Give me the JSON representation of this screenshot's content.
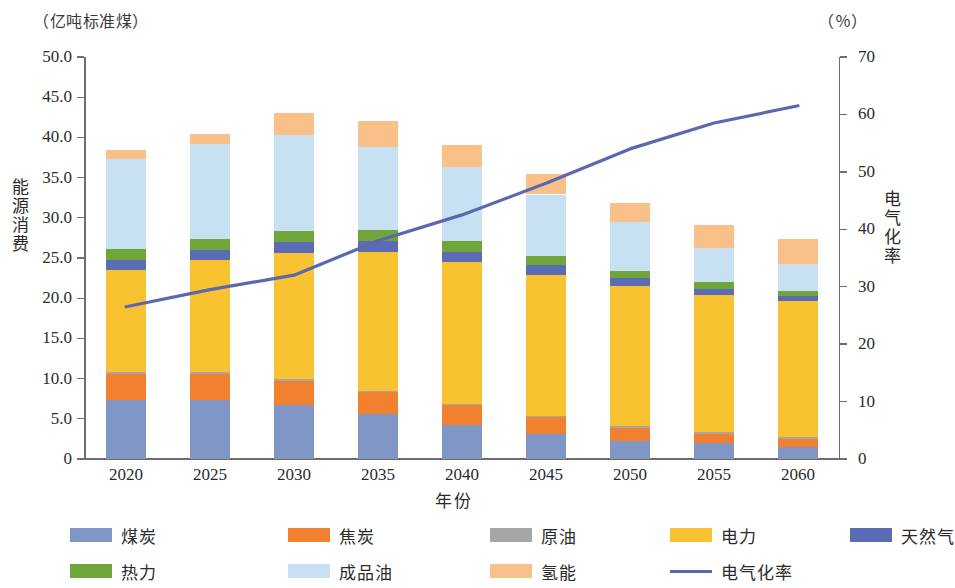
{
  "axes": {
    "left_unit": "（亿吨标准煤）",
    "right_unit": "（％）",
    "left_title": "能源消费",
    "right_title": "电气化率",
    "x_title": "年份",
    "left_ticks": [
      "0",
      "5.0",
      "10.0",
      "15.0",
      "20.0",
      "25.0",
      "30.0",
      "35.0",
      "40.0",
      "45.0",
      "50.0"
    ],
    "right_ticks": [
      "0",
      "10",
      "20",
      "30",
      "40",
      "50",
      "60",
      "70"
    ]
  },
  "legend": {
    "rows": [
      [
        {
          "label": "煤炭",
          "color": "#8096c4",
          "type": "swatch"
        },
        {
          "label": "焦炭",
          "color": "#f2812f",
          "type": "swatch"
        },
        {
          "label": "原油",
          "color": "#a6a6a6",
          "type": "swatch"
        },
        {
          "label": "电力",
          "color": "#f9c230",
          "type": "swatch"
        },
        {
          "label": "天然气",
          "color": "#5b6cb5",
          "type": "swatch"
        }
      ],
      [
        {
          "label": "热力",
          "color": "#6fa539",
          "type": "swatch"
        },
        {
          "label": "成品油",
          "color": "#c7e1f2",
          "type": "swatch"
        },
        {
          "label": "氢能",
          "color": "#f9c08a",
          "type": "swatch"
        },
        {
          "label": "电气化率",
          "color": "#5b68b0",
          "type": "line"
        }
      ]
    ]
  },
  "chart_data": {
    "type": "bar",
    "title": "",
    "xlabel": "年份",
    "ylabel": "能源消费",
    "y2label": "电气化率",
    "ylim": [
      0,
      50
    ],
    "y2lim": [
      0,
      70
    ],
    "grid": false,
    "legend_position": "bottom",
    "stacked": true,
    "categories": [
      "2020",
      "2025",
      "2030",
      "2035",
      "2040",
      "2045",
      "2050",
      "2055",
      "2060"
    ],
    "series": [
      {
        "name": "煤炭",
        "color": "#8096c4",
        "values": [
          7.4,
          7.4,
          6.7,
          5.6,
          4.2,
          3.1,
          2.3,
          2.0,
          1.5
        ]
      },
      {
        "name": "焦炭",
        "color": "#f2812f",
        "values": [
          3.2,
          3.2,
          3.0,
          2.7,
          2.5,
          2.1,
          1.6,
          1.1,
          1.0
        ]
      },
      {
        "name": "原油",
        "color": "#a6a6a6",
        "values": [
          0.2,
          0.2,
          0.2,
          0.2,
          0.2,
          0.2,
          0.2,
          0.2,
          0.2
        ]
      },
      {
        "name": "电力",
        "color": "#f9c230",
        "values": [
          12.7,
          13.9,
          15.7,
          17.2,
          17.6,
          17.5,
          17.4,
          17.1,
          16.9
        ]
      },
      {
        "name": "天然气",
        "color": "#5b6cb5",
        "values": [
          1.3,
          1.3,
          1.4,
          1.4,
          1.3,
          1.2,
          1.0,
          0.8,
          0.7
        ]
      },
      {
        "name": "热力",
        "color": "#6fa539",
        "values": [
          1.3,
          1.4,
          1.4,
          1.4,
          1.3,
          1.2,
          0.9,
          0.8,
          0.6
        ]
      },
      {
        "name": "成品油",
        "color": "#c7e1f2",
        "values": [
          11.2,
          11.8,
          11.9,
          10.3,
          9.2,
          7.6,
          6.1,
          4.2,
          3.3
        ]
      },
      {
        "name": "氢能",
        "color": "#f9c08a",
        "values": [
          1.1,
          1.2,
          2.8,
          3.2,
          2.7,
          2.6,
          2.4,
          2.9,
          3.2
        ]
      }
    ],
    "totals": [
      38.4,
      40.4,
      43.1,
      42.0,
      39.0,
      35.5,
      31.9,
      29.1,
      27.4
    ],
    "line_series": {
      "name": "电气化率",
      "color": "#5b68b0",
      "axis": "right",
      "unit": "%",
      "values": [
        26.5,
        29.5,
        32.0,
        38.0,
        42.5,
        48.0,
        54.0,
        58.5,
        61.5
      ]
    }
  }
}
